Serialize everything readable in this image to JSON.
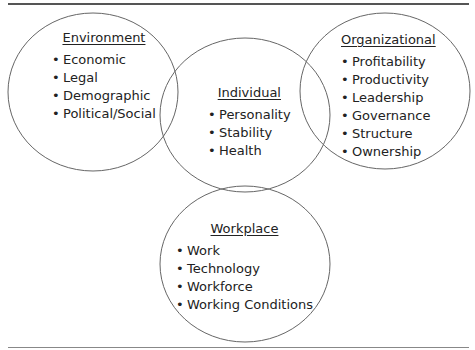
{
  "diagram": {
    "type": "venn",
    "groups": [
      {
        "id": "environment",
        "title": "Environment",
        "items": [
          "Economic",
          "Legal",
          "Demographic",
          "Political/Social"
        ]
      },
      {
        "id": "individual",
        "title": "Individual",
        "items": [
          "Personality",
          "Stability",
          "Health"
        ]
      },
      {
        "id": "organizational",
        "title": "Organizational",
        "items": [
          "Profitability",
          "Productivity",
          "Leadership",
          "Governance",
          "Structure",
          "Ownership"
        ]
      },
      {
        "id": "workplace",
        "title": "Workplace",
        "items": [
          "Work",
          "Technology",
          "Workforce",
          "Working Conditions"
        ]
      }
    ],
    "colors": {
      "stroke": "#555555",
      "text": "#222222",
      "rule": "#555555"
    }
  }
}
